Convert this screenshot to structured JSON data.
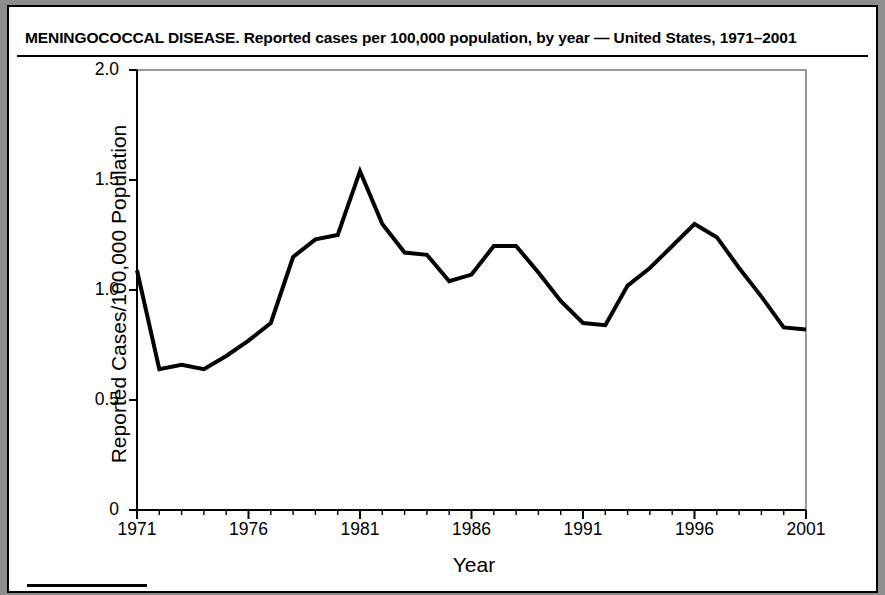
{
  "figure": {
    "title": "MENINGOCOCCAL DISEASE. Reported cases per 100,000 population, by year — United States, 1971–2001",
    "footnote": "Rates of meningococcal disease have been relatively stable in the United States. A total of 2,333 cases were reported in 2001, of which 1,031 were confirmed. 77"
  },
  "chart_data": {
    "type": "line",
    "title": "MENINGOCOCCAL DISEASE. Reported cases per 100,000 population, by year — United States, 1971–2001",
    "xlabel": "Year",
    "ylabel": "Reported Cases/100,000 Population",
    "xlim": [
      1971,
      2001
    ],
    "ylim": [
      0,
      2.0
    ],
    "grid": false,
    "legend": "none",
    "line_color": "#000000",
    "line_width": 4,
    "ytick_labels": [
      "0",
      "0.5",
      "1.0",
      "1.5",
      "2.0"
    ],
    "ytick_values": [
      0,
      0.5,
      1.0,
      1.5,
      2.0
    ],
    "xtick_labels": [
      "1971",
      "1976",
      "1981",
      "1986",
      "1991",
      "1996",
      "2001"
    ],
    "xtick_values": [
      1971,
      1976,
      1981,
      1986,
      1991,
      1996,
      2001
    ],
    "minor_xticks_every": 1,
    "x": [
      1971,
      1972,
      1973,
      1974,
      1975,
      1976,
      1977,
      1978,
      1979,
      1980,
      1981,
      1982,
      1983,
      1984,
      1985,
      1986,
      1987,
      1988,
      1989,
      1990,
      1991,
      1992,
      1993,
      1994,
      1995,
      1996,
      1997,
      1998,
      1999,
      2000,
      2001
    ],
    "values": [
      1.09,
      0.64,
      0.66,
      0.64,
      0.7,
      0.77,
      0.85,
      1.15,
      1.23,
      1.25,
      1.54,
      1.3,
      1.17,
      1.16,
      1.04,
      1.07,
      1.2,
      1.2,
      1.08,
      0.95,
      0.85,
      0.84,
      1.02,
      1.1,
      1.2,
      1.3,
      1.24,
      1.1,
      0.97,
      0.83,
      0.82
    ]
  }
}
